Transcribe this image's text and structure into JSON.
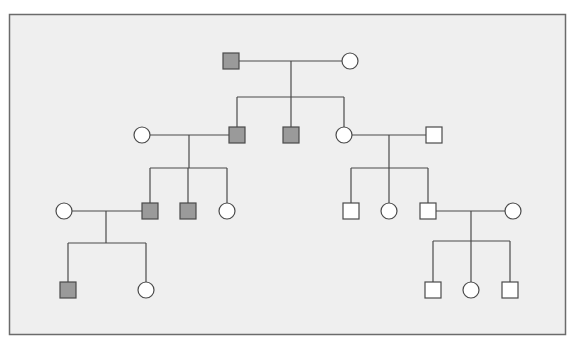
{
  "diagram": {
    "type": "pedigree",
    "colors": {
      "page_background": "#ffffff",
      "panel_background": "#efefef",
      "panel_border": "#6b6b6b",
      "line": "#4a4a4a",
      "affected_fill": "#9a9a9a",
      "unaffected_fill": "#ffffff"
    },
    "panel": {
      "x": 9,
      "y": 14,
      "width": 556,
      "height": 320
    },
    "symbol_size": 16,
    "individuals": [
      {
        "id": "I-1",
        "sex": "male",
        "affected": true,
        "x": 231,
        "y": 61
      },
      {
        "id": "I-2",
        "sex": "female",
        "affected": false,
        "x": 350,
        "y": 61
      },
      {
        "id": "II-1",
        "sex": "female",
        "affected": false,
        "x": 142,
        "y": 135
      },
      {
        "id": "II-2",
        "sex": "male",
        "affected": true,
        "x": 237,
        "y": 135
      },
      {
        "id": "II-3",
        "sex": "male",
        "affected": true,
        "x": 291,
        "y": 135
      },
      {
        "id": "II-4",
        "sex": "female",
        "affected": false,
        "x": 344,
        "y": 135
      },
      {
        "id": "II-5",
        "sex": "male",
        "affected": false,
        "x": 434,
        "y": 135
      },
      {
        "id": "III-1",
        "sex": "female",
        "affected": false,
        "x": 64,
        "y": 211
      },
      {
        "id": "III-2",
        "sex": "male",
        "affected": true,
        "x": 150,
        "y": 211
      },
      {
        "id": "III-3",
        "sex": "male",
        "affected": true,
        "x": 188,
        "y": 211
      },
      {
        "id": "III-4",
        "sex": "female",
        "affected": false,
        "x": 227,
        "y": 211
      },
      {
        "id": "III-5",
        "sex": "male",
        "affected": false,
        "x": 351,
        "y": 211
      },
      {
        "id": "III-6",
        "sex": "female",
        "affected": false,
        "x": 389,
        "y": 211
      },
      {
        "id": "III-7",
        "sex": "male",
        "affected": false,
        "x": 428,
        "y": 211
      },
      {
        "id": "III-8",
        "sex": "female",
        "affected": false,
        "x": 513,
        "y": 211
      },
      {
        "id": "IV-1",
        "sex": "male",
        "affected": true,
        "x": 68,
        "y": 290
      },
      {
        "id": "IV-2",
        "sex": "female",
        "affected": false,
        "x": 146,
        "y": 290
      },
      {
        "id": "IV-3",
        "sex": "male",
        "affected": false,
        "x": 433,
        "y": 290
      },
      {
        "id": "IV-4",
        "sex": "female",
        "affected": false,
        "x": 471,
        "y": 290
      },
      {
        "id": "IV-5",
        "sex": "male",
        "affected": false,
        "x": 510,
        "y": 290
      }
    ],
    "families": [
      {
        "parents": [
          "I-1",
          "I-2"
        ],
        "mating_y": 61,
        "drop_x": 291,
        "sibship_y": 97,
        "children": [
          "II-2",
          "II-3",
          "II-4"
        ]
      },
      {
        "parents": [
          "II-1",
          "II-2"
        ],
        "mating_y": 135,
        "drop_x": 189,
        "sibship_y": 168,
        "children": [
          "III-2",
          "III-3",
          "III-4"
        ]
      },
      {
        "parents": [
          "II-4",
          "II-5"
        ],
        "mating_y": 135,
        "drop_x": 389,
        "sibship_y": 168,
        "children": [
          "III-5",
          "III-6",
          "III-7"
        ]
      },
      {
        "parents": [
          "III-1",
          "III-2"
        ],
        "mating_y": 211,
        "drop_x": 106,
        "sibship_y": 243,
        "children": [
          "IV-1",
          "IV-2"
        ]
      },
      {
        "parents": [
          "III-7",
          "III-8"
        ],
        "mating_y": 211,
        "drop_x": 471,
        "sibship_y": 241,
        "children": [
          "IV-3",
          "IV-4",
          "IV-5"
        ]
      }
    ]
  }
}
